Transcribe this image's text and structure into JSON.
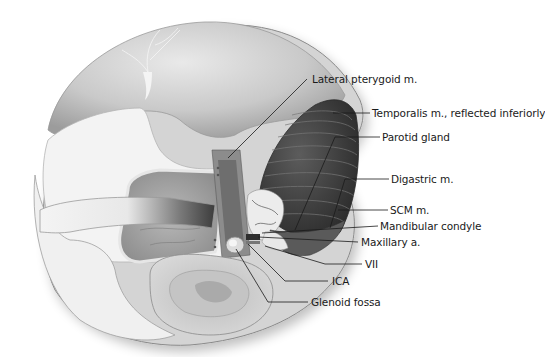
{
  "figure": {
    "colors": {
      "background": "#ffffff",
      "scalp_light": "#e6e6e6",
      "scalp_mid": "#bdbdbd",
      "bone": "#f2f2f2",
      "muscle_dark": "#3a3a3a",
      "muscle_stripe": "#6b6b6b",
      "leader_line": "#1a1a1a",
      "label_text": "#1a1a1a"
    }
  },
  "labels": [
    {
      "id": "lateral-pterygoid",
      "text": "Lateral pterygoid m."
    },
    {
      "id": "temporalis",
      "text": "Temporalis m., reflected inferiorly"
    },
    {
      "id": "parotid",
      "text": "Parotid gland"
    },
    {
      "id": "digastric",
      "text": "Digastric m."
    },
    {
      "id": "scm",
      "text": "SCM m."
    },
    {
      "id": "mandibular-condyle",
      "text": "Mandibular condyle"
    },
    {
      "id": "maxillary-artery",
      "text": "Maxillary a."
    },
    {
      "id": "facial-nerve",
      "text": "VII"
    },
    {
      "id": "ica",
      "text": "ICA"
    },
    {
      "id": "glenoid-fossa",
      "text": "Glenoid fossa"
    }
  ]
}
